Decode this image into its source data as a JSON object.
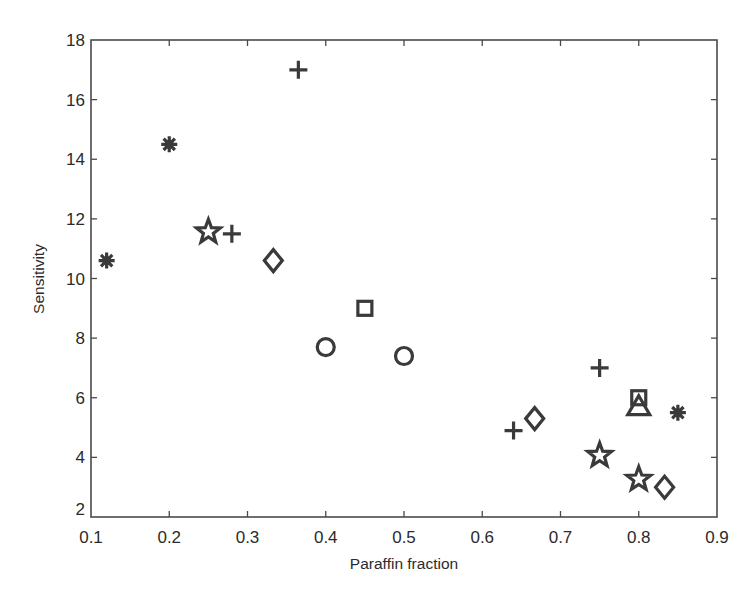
{
  "figure": {
    "background": "#ffffff",
    "ink_color": "#3a3a3a"
  },
  "chart_data": {
    "type": "scatter",
    "title": "",
    "xlabel": "Paraffin fraction",
    "ylabel": "Sensitivity",
    "xlim": [
      0.1,
      0.9
    ],
    "ylim": [
      2,
      18
    ],
    "xticks": [
      0.1,
      0.2,
      0.3,
      0.4,
      0.5,
      0.6,
      0.7,
      0.8,
      0.9
    ],
    "xtick_labels": [
      "0.1",
      "0.2",
      "0.3",
      "0.4",
      "0.5",
      "0.6",
      "0.7",
      "0.8",
      "0.9"
    ],
    "yticks": [
      2,
      4,
      6,
      8,
      10,
      12,
      14,
      16,
      18
    ],
    "ytick_labels": [
      "2",
      "4",
      "6",
      "8",
      "10",
      "12",
      "14",
      "16",
      "18"
    ],
    "grid": false,
    "legend": null,
    "series": [
      {
        "name": "asterisk",
        "marker": "asterisk",
        "points": [
          {
            "x": 0.12,
            "y": 10.6
          },
          {
            "x": 0.2,
            "y": 14.5
          },
          {
            "x": 0.85,
            "y": 5.5
          }
        ]
      },
      {
        "name": "plus",
        "marker": "plus",
        "points": [
          {
            "x": 0.28,
            "y": 11.5
          },
          {
            "x": 0.365,
            "y": 17.0
          },
          {
            "x": 0.64,
            "y": 4.9
          },
          {
            "x": 0.75,
            "y": 7.0
          }
        ]
      },
      {
        "name": "pentagram",
        "marker": "star",
        "points": [
          {
            "x": 0.25,
            "y": 11.6
          },
          {
            "x": 0.75,
            "y": 4.1
          },
          {
            "x": 0.8,
            "y": 3.3
          }
        ]
      },
      {
        "name": "diamond",
        "marker": "diamond",
        "points": [
          {
            "x": 0.333,
            "y": 10.6
          },
          {
            "x": 0.667,
            "y": 5.3
          },
          {
            "x": 0.833,
            "y": 3.0
          }
        ]
      },
      {
        "name": "square",
        "marker": "square",
        "points": [
          {
            "x": 0.45,
            "y": 9.0
          },
          {
            "x": 0.8,
            "y": 6.0
          }
        ]
      },
      {
        "name": "circle",
        "marker": "circle",
        "points": [
          {
            "x": 0.4,
            "y": 7.7
          },
          {
            "x": 0.5,
            "y": 7.4
          }
        ]
      },
      {
        "name": "triangle",
        "marker": "triangle",
        "points": [
          {
            "x": 0.8,
            "y": 5.7
          }
        ]
      }
    ]
  }
}
